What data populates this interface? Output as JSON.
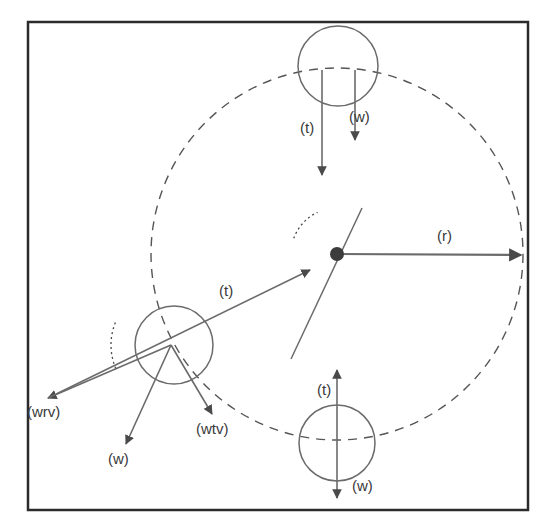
{
  "figure": {
    "background_color": "#ffffff",
    "frame": {
      "stroke": "#2b2b2b",
      "x": 28,
      "y": 22,
      "width": 500,
      "height": 488
    },
    "colors": {
      "line": "#6b6b6b",
      "dark_line": "#4a4a4a",
      "text": "#3a3a3a",
      "dashed": "#555555",
      "hub": "#3c3c3c"
    }
  },
  "orbit": {
    "name": "dashed-orbit-circle",
    "center_x": 337,
    "center_y": 254,
    "radius": 186,
    "style": "dashed"
  },
  "hub": {
    "name": "center-pivot",
    "x": 337,
    "y": 254,
    "radius": 7
  },
  "radius_vector": {
    "label": "(r)",
    "label_x": 437,
    "label_y": 241,
    "from_x": 337,
    "from_y": 254,
    "to_x": 521,
    "to_y": 255
  },
  "bodies": [
    {
      "id": "top-body",
      "name": "top-circle-body",
      "cx": 338,
      "cy": 66,
      "r": 40,
      "forces": [
        {
          "label": "(t)",
          "name": "tension-force-top",
          "label_x": 300,
          "label_y": 133,
          "from_x": 322,
          "from_y": 70,
          "to_x": 322,
          "to_y": 175,
          "direction": "down"
        },
        {
          "label": "(w)",
          "name": "weight-force-top",
          "label_x": 349,
          "label_y": 122,
          "from_x": 355,
          "from_y": 70,
          "to_x": 355,
          "to_y": 140,
          "direction": "down"
        }
      ]
    },
    {
      "id": "left-body",
      "name": "left-circle-body",
      "cx": 174,
      "cy": 345,
      "r": 39,
      "forces": [
        {
          "label": "(wrv)",
          "name": "radial-weight-component",
          "label_x": 27,
          "label_y": 417,
          "from_x": 171,
          "from_y": 345,
          "to_x": 48,
          "to_y": 398,
          "direction": "down-left"
        },
        {
          "label": "(w)",
          "name": "weight-force-left",
          "label_x": 108,
          "label_y": 464,
          "from_x": 171,
          "from_y": 345,
          "to_x": 126,
          "to_y": 444,
          "direction": "down-left"
        },
        {
          "label": "(wtv)",
          "name": "tangential-weight-component",
          "label_x": 196,
          "label_y": 434,
          "from_x": 171,
          "from_y": 345,
          "to_x": 212,
          "to_y": 414,
          "direction": "down-right"
        }
      ]
    },
    {
      "id": "bottom-body",
      "name": "bottom-circle-body",
      "cx": 337,
      "cy": 443,
      "r": 38,
      "forces": [
        {
          "label": "(t)",
          "name": "tension-force-bottom",
          "label_x": 317,
          "label_y": 395,
          "from_x": 337,
          "from_y": 443,
          "to_x": 337,
          "to_y": 370,
          "direction": "up"
        },
        {
          "label": "(w)",
          "name": "weight-force-bottom",
          "label_x": 352,
          "label_y": 491,
          "from_x": 337,
          "from_y": 443,
          "to_x": 337,
          "to_y": 498,
          "direction": "down"
        }
      ]
    }
  ],
  "tension_vector": {
    "label": "(t)",
    "name": "tension-force-left",
    "label_x": 219,
    "label_y": 296,
    "from_x": 48,
    "from_y": 398,
    "to_x": 310,
    "to_y": 270
  },
  "radial_line": {
    "name": "radial-reference-line",
    "from_x": 362,
    "from_y": 208,
    "to_x": 291,
    "to_y": 359
  },
  "angle_arcs": [
    {
      "name": "center-angle-arc",
      "cx": 337,
      "cy": 254,
      "radius": 46,
      "start_deg": 160,
      "end_deg": 115
    },
    {
      "name": "left-body-angle-arc",
      "cx": 171,
      "cy": 345,
      "radius": 60,
      "start_deg": 203,
      "end_deg": 156
    }
  ]
}
